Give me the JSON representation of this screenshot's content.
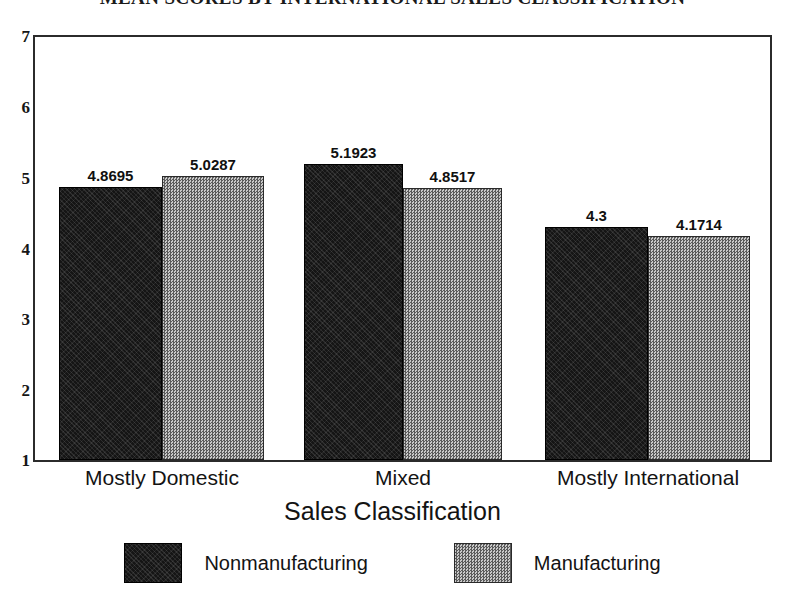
{
  "chart_data": {
    "type": "bar",
    "title": "MEAN SCORES BY INTERNATIONAL SALES CLASSIFICATION",
    "title_clipped": true,
    "xlabel": "Sales Classification",
    "ylabel": "",
    "categories": [
      "Mostly Domestic",
      "Mixed",
      "Mostly International"
    ],
    "series": [
      {
        "name": "Nonmanufacturing",
        "values": [
          4.8695,
          5.1923,
          4.3
        ],
        "value_labels": [
          "4.8695",
          "5.1923",
          "4.3"
        ],
        "color": "#151515",
        "pattern": "solid-dark"
      },
      {
        "name": "Manufacturing",
        "values": [
          5.0287,
          4.8517,
          4.1714
        ],
        "value_labels": [
          "5.0287",
          "4.8517",
          "4.1714"
        ],
        "color": "#8f8f8f",
        "pattern": "dither-gray"
      }
    ],
    "ylim": [
      1,
      7
    ],
    "y_ticks": [
      1,
      2,
      3,
      4,
      5,
      6,
      7
    ],
    "y_tick_labels": [
      "1",
      "2",
      "3",
      "4",
      "5",
      "6",
      "7"
    ],
    "grid": false,
    "legend_position": "bottom",
    "frame": true,
    "bar_gap_within_group": 0
  },
  "axis": {
    "y_labels": [
      "7",
      "6",
      "5",
      "4",
      "3",
      "2",
      "1"
    ],
    "x_title": "Sales Classification"
  },
  "legend": {
    "entries": [
      {
        "label": "Nonmanufacturing",
        "swatch": "dark-swatch-icon"
      },
      {
        "label": "Manufacturing",
        "swatch": "gray-swatch-icon"
      }
    ]
  }
}
